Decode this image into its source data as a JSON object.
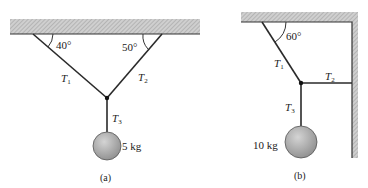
{
  "figure_a": {
    "caption": "(a)",
    "angle_left": "40°",
    "angle_right": "50°",
    "tension_1": {
      "symbol": "T",
      "sub": "1"
    },
    "tension_2": {
      "symbol": "T",
      "sub": "2"
    },
    "tension_3": {
      "symbol": "T",
      "sub": "3"
    },
    "mass_label": "5 kg"
  },
  "figure_b": {
    "caption": "(b)",
    "angle": "60°",
    "tension_1": {
      "symbol": "T",
      "sub": "1"
    },
    "tension_2": {
      "symbol": "T",
      "sub": "2"
    },
    "tension_3": {
      "symbol": "T",
      "sub": "3"
    },
    "mass_label": "10 kg"
  },
  "colors": {
    "rope": "#2a2a2a",
    "hatch": "#b8b8b8",
    "ball": "#a8a8a8"
  }
}
